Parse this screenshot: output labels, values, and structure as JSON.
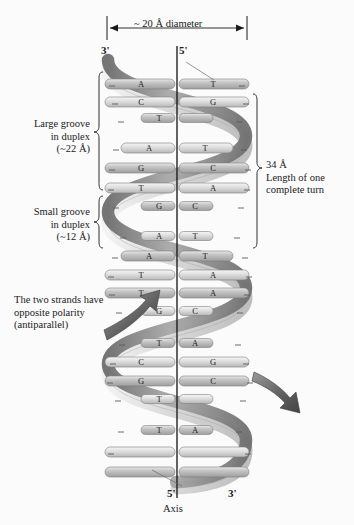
{
  "figure": {
    "background_color": "#fbfbfb"
  },
  "dimension_top": {
    "label": "~ 20 Å diameter",
    "arrow_left": "left-arrow",
    "arrow_right": "right-arrow"
  },
  "top_labels": {
    "left_prime": "3'",
    "right_prime": "5'"
  },
  "bottom_labels": {
    "left_prime": "5'",
    "right_prime": "3'",
    "axis": "Axis"
  },
  "annotations": {
    "large_groove": {
      "line1": "Large groove",
      "line2": "in duplex",
      "line3": "(~22 Å)"
    },
    "small_groove": {
      "line1": "Small groove",
      "line2": "in duplex",
      "line3": "(~12 Å)"
    },
    "antiparallel": {
      "line1": "The two strands have",
      "line2": "opposite polarity",
      "line3": "(antiparallel)"
    },
    "turn_length": {
      "line1": "34 Å",
      "line2": "Length of one",
      "line3": "complete turn"
    }
  },
  "base_pairs": [
    {
      "left": "A",
      "right": "T",
      "y": 84,
      "width": "wide"
    },
    {
      "left": "C",
      "right": "G",
      "y": 102,
      "width": "wide"
    },
    {
      "left": "T",
      "right": "",
      "y": 118,
      "width": "narrow"
    },
    {
      "left": "A",
      "right": "T",
      "y": 148,
      "width": "medium"
    },
    {
      "left": "G",
      "right": "C",
      "y": 168,
      "width": "wide"
    },
    {
      "left": "T",
      "right": "A",
      "y": 188,
      "width": "wide"
    },
    {
      "left": "G",
      "right": "C",
      "y": 206,
      "width": "narrow"
    },
    {
      "left": "A",
      "right": "T",
      "y": 236,
      "width": "narrow"
    },
    {
      "left": "A",
      "right": "T",
      "y": 256,
      "width": "medium"
    },
    {
      "left": "T",
      "right": "A",
      "y": 275,
      "width": "wide"
    },
    {
      "left": "T",
      "right": "A",
      "y": 293,
      "width": "wide"
    },
    {
      "left": "G",
      "right": "C",
      "y": 311,
      "width": "narrow"
    },
    {
      "left": "T",
      "right": "A",
      "y": 343,
      "width": "narrow"
    },
    {
      "left": "C",
      "right": "G",
      "y": 362,
      "width": "wide"
    },
    {
      "left": "G",
      "right": "C",
      "y": 381,
      "width": "wide"
    },
    {
      "left": "T",
      "right": "",
      "y": 399,
      "width": "narrow"
    },
    {
      "left": "T",
      "right": "A",
      "y": 430,
      "width": "narrow"
    },
    {
      "left": "",
      "right": "",
      "y": 452,
      "width": "wide"
    },
    {
      "left": "",
      "right": "",
      "y": 472,
      "width": "wide"
    }
  ],
  "colors": {
    "ribbon_dark": "#8a8a8a",
    "ribbon_light": "#dcdcdc",
    "rung_fill": "#c9c9c9",
    "ink": "#1a1a1a"
  },
  "axis": {
    "label": "Axis",
    "visible": true
  }
}
